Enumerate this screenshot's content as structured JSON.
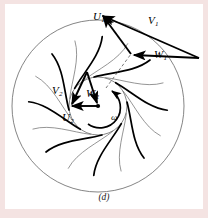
{
  "figure": {
    "caption": "(d)",
    "background_color": "#ffffff",
    "border_color": "#f4e3e2",
    "line_color": "#000000",
    "rim_color": "#555555"
  },
  "labels": {
    "U1": "U",
    "U1_sub": "1",
    "V1": "V",
    "V1_sub": "1",
    "W1": "W",
    "W1_sub": "1",
    "U2": "U",
    "U2_sub": "2",
    "V2": "V",
    "V2_sub": "2",
    "W2": "W",
    "W2_sub": "2",
    "omega": "ω"
  },
  "geometry": {
    "outer_radius": 86,
    "inner_radius": 29,
    "center_x": 98,
    "center_y": 106,
    "blade_count": 8,
    "blade_type": "backward-curved",
    "rotation_direction": "clockwise"
  },
  "vectors": {
    "outlet": [
      {
        "name": "U1",
        "from": [
          130,
          53
        ],
        "to": [
          100,
          14
        ],
        "style": "solid-arrow"
      },
      {
        "name": "V1",
        "from": [
          199,
          57
        ],
        "to": [
          100,
          14
        ],
        "style": "solid-arrow"
      },
      {
        "name": "W1",
        "from": [
          199,
          57
        ],
        "to": [
          130,
          53
        ],
        "style": "solid-arrow"
      }
    ],
    "inlet": [
      {
        "name": "U2",
        "from": [
          98,
          106
        ],
        "to": [
          70,
          106
        ],
        "style": "solid-arrow"
      },
      {
        "name": "V2",
        "from": [
          86,
          74
        ],
        "to": [
          70,
          106
        ],
        "style": "solid-arrow"
      },
      {
        "name": "W2",
        "from": [
          86,
          74
        ],
        "to": [
          98,
          106
        ],
        "style": "solid-arrow"
      }
    ],
    "dashed_radius": {
      "from": [
        108,
        85
      ],
      "to": [
        130,
        53
      ],
      "style": "dashed"
    },
    "omega_arc": {
      "center": [
        98,
        106
      ],
      "radius": 19,
      "direction": "clockwise"
    }
  }
}
